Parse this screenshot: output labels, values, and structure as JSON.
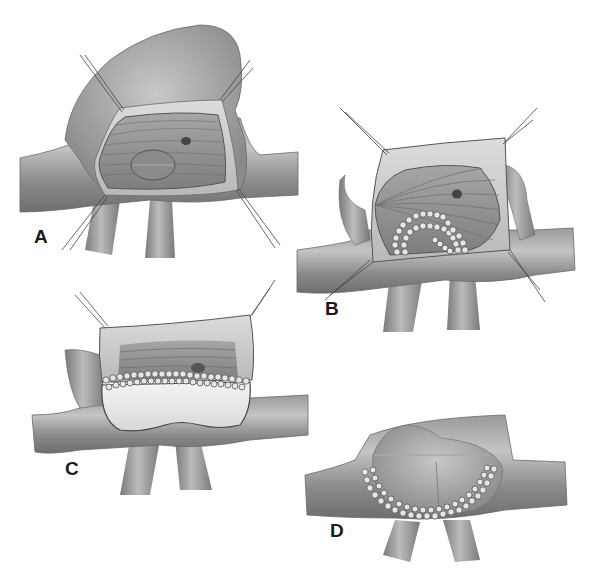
{
  "figure": {
    "panels": [
      {
        "id": "A",
        "label": "A",
        "stage": "exposed lumen with stay sutures and oval defect"
      },
      {
        "id": "B",
        "label": "B",
        "stage": "suture line placed around defect"
      },
      {
        "id": "C",
        "label": "C",
        "stage": "patch sewn along upper margin"
      },
      {
        "id": "D",
        "label": "D",
        "stage": "completed patch repair with continuous suture line"
      }
    ],
    "colors": {
      "vessel": "#8c8c8c",
      "vessel_light": "#bdbdbd",
      "vessel_dark": "#5e5e5e",
      "lumen": "#9a9a9a",
      "patch": "#e8e8e8",
      "suture": "#4a4a4a",
      "label": "#1a1a1a"
    }
  }
}
